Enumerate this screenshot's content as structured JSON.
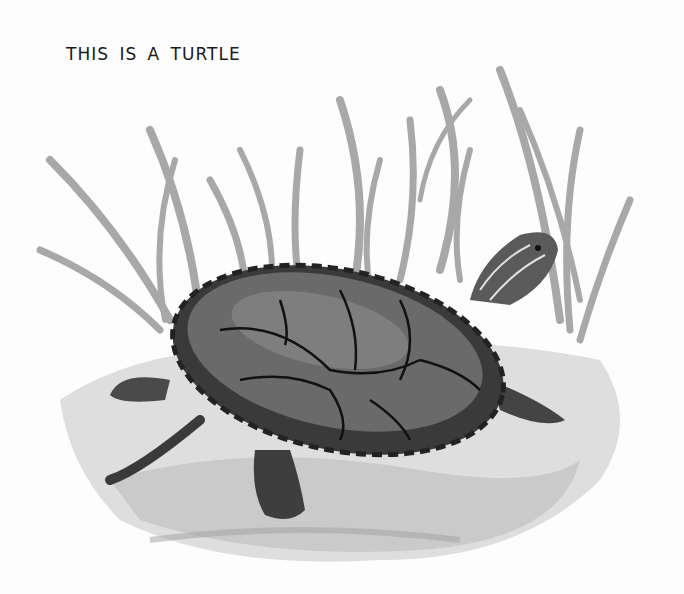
{
  "caption": "THIS IS A TURTLE",
  "illustration": {
    "subject": "turtle",
    "style": "grayscale watercolor",
    "elements": [
      "grass-clump",
      "turtle-shell",
      "turtle-head",
      "turtle-legs",
      "ground-wash"
    ]
  },
  "colors": {
    "background": "#fdfdfd",
    "ink": "#1a1a1a",
    "shell_dark": "#3a3a3a",
    "shell_mid": "#6a6a6a",
    "grass": "#9a9a9a",
    "ground": "#c8c8c8"
  }
}
